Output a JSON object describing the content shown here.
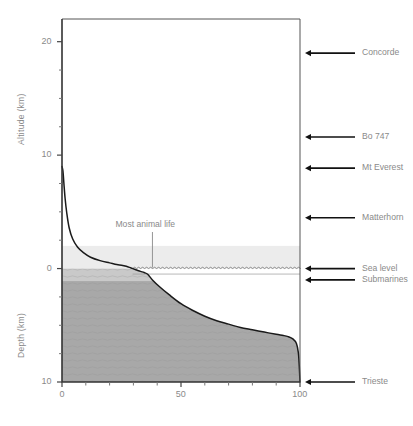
{
  "figure": {
    "title": "",
    "background": "#ffffff",
    "axis_color": "#4d4d4d",
    "text_color": "#8a8a8a"
  },
  "axes": {
    "y_upper_label": "Altitude (km)",
    "y_lower_label": "Depth (km)",
    "x_label": "",
    "y_ticks": [
      {
        "label": "20",
        "value": 20
      },
      {
        "label": "10",
        "value": 10
      },
      {
        "label": "0",
        "value": 0
      },
      {
        "label": "10",
        "value": -10
      }
    ],
    "y_minor_step": 2.5,
    "x_ticks": [
      {
        "label": "0",
        "value": 0
      },
      {
        "label": "50",
        "value": 50
      },
      {
        "label": "100",
        "value": 100
      }
    ],
    "x_minor_step": 10
  },
  "callouts": [
    {
      "name": "most-animal-life",
      "label": "Most animal life",
      "x_pct": 38,
      "altitude_km": 0
    }
  ],
  "markers": [
    {
      "name": "concorde",
      "label": "Concorde",
      "altitude_km": 19.0
    },
    {
      "name": "bo-747",
      "label": "Bo 747",
      "altitude_km": 11.6
    },
    {
      "name": "mt-everest",
      "label": "Mt Everest",
      "altitude_km": 8.85
    },
    {
      "name": "matterhorn",
      "label": "Matterhorn",
      "altitude_km": 4.48
    },
    {
      "name": "sea-level",
      "label": "Sea level",
      "altitude_km": 0.0
    },
    {
      "name": "submarines",
      "label": "Submarines",
      "altitude_km": -1.0
    },
    {
      "name": "trieste",
      "label": "Trieste",
      "altitude_km": -10.0
    }
  ],
  "chart_data": {
    "type": "area",
    "title": "",
    "xlabel": "",
    "ylabel": "Altitude (km) / Depth (km)",
    "xlim": [
      0,
      100
    ],
    "ylim": [
      -10,
      22
    ],
    "grid": false,
    "legend": null,
    "series": [
      {
        "name": "Earth surface hypsographic curve",
        "x": [
          0,
          0.4,
          0.8,
          1.3,
          2.0,
          3.0,
          4.5,
          6.5,
          9.0,
          12.0,
          16.0,
          20.0,
          23.0,
          25.0,
          27.0,
          29.0,
          31.0,
          33.0,
          34.5,
          36.0,
          38.0,
          41.0,
          45.0,
          50.0,
          55.0,
          60.0,
          65.0,
          70.0,
          75.0,
          80.0,
          85.0,
          90.0,
          93.0,
          95.0,
          97.0,
          98.5,
          99.3,
          99.7,
          100.0
        ],
        "y": [
          9.0,
          8.6,
          7.5,
          6.2,
          4.9,
          3.6,
          2.6,
          1.9,
          1.4,
          1.0,
          0.7,
          0.5,
          0.35,
          0.3,
          0.2,
          0.05,
          -0.1,
          -0.25,
          -0.35,
          -0.5,
          -1.0,
          -1.6,
          -2.3,
          -3.1,
          -3.7,
          -4.2,
          -4.6,
          -4.9,
          -5.2,
          -5.4,
          -5.6,
          -5.8,
          -5.9,
          -6.0,
          -6.2,
          -6.6,
          -7.4,
          -8.6,
          -10.0
        ]
      }
    ],
    "bands": [
      {
        "name": "atmosphere-photic-band",
        "from_km": 2.0,
        "to_km": 0.0,
        "color": "#ececec"
      },
      {
        "name": "upper-ocean-band",
        "from_km": 0.0,
        "to_km": -1.1,
        "color": "#c9c9c9"
      },
      {
        "name": "deep-ocean-band",
        "from_km": -1.1,
        "to_km": -10.0,
        "color": "#a8a8a8"
      }
    ],
    "sea_surface": {
      "name": "wavy-sea-surface",
      "altitude_km": 0.0,
      "style": "wavy"
    }
  }
}
